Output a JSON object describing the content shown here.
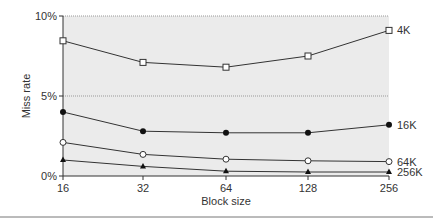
{
  "chart_data": {
    "type": "line",
    "title": "",
    "xlabel": "Block size",
    "ylabel": "Miss rate",
    "x": [
      16,
      32,
      64,
      128,
      256
    ],
    "x_tick_labels": [
      "16",
      "32",
      "64",
      "128",
      "256"
    ],
    "y_tick_labels": [
      "0%",
      "5%",
      "10%"
    ],
    "ylim": [
      0,
      10
    ],
    "grid": "horizontal dotted at 5% and 10%",
    "legend_position": "inline labels at right end of each line",
    "series": [
      {
        "name": "4K",
        "marker": "open-square",
        "values": [
          8.45,
          7.1,
          6.8,
          7.5,
          9.1
        ]
      },
      {
        "name": "16K",
        "marker": "filled-circle",
        "values": [
          4.0,
          2.8,
          2.7,
          2.7,
          3.2
        ]
      },
      {
        "name": "64K",
        "marker": "open-circle",
        "values": [
          2.1,
          1.35,
          1.05,
          0.95,
          0.9
        ]
      },
      {
        "name": "256K",
        "marker": "filled-triangle",
        "values": [
          1.0,
          0.6,
          0.3,
          0.25,
          0.25
        ]
      }
    ]
  },
  "colors": {
    "plot_bg": "#ebebeb",
    "line": "#333333",
    "grid": "#999999"
  }
}
